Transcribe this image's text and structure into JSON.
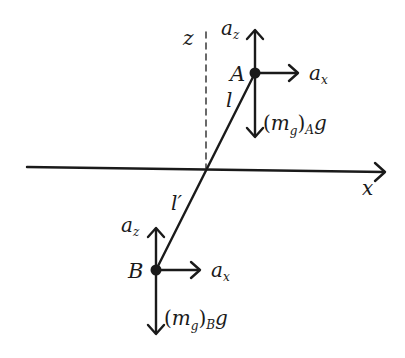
{
  "diagram": {
    "axes": {
      "x_label": "x",
      "z_label": "z"
    },
    "rod": {
      "upper_segment_label": "l",
      "lower_segment_label": "l′"
    },
    "point_A": {
      "label": "A",
      "az_base": "a",
      "az_sub": "z",
      "ax_base": "a",
      "ax_sub": "x",
      "weight_prefix": "(m",
      "weight_g_sub": "g",
      "weight_close": ")",
      "weight_body_sub": "A",
      "weight_suffix": "g"
    },
    "point_B": {
      "label": "B",
      "az_base": "a",
      "az_sub": "z",
      "ax_base": "a",
      "ax_sub": "x",
      "weight_prefix": "(m",
      "weight_g_sub": "g",
      "weight_close": ")",
      "weight_body_sub": "B",
      "weight_suffix": "g"
    },
    "colors": {
      "ink": "#1a1a1a",
      "background": "#ffffff"
    }
  }
}
